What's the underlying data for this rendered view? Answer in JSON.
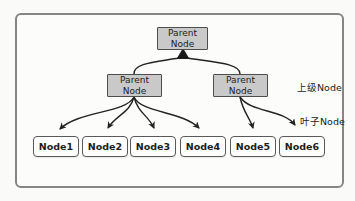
{
  "diagram": {
    "root": {
      "label": "Parent Node"
    },
    "parents": [
      {
        "label": "Parent Node"
      },
      {
        "label": "Parent Node"
      }
    ],
    "leaves": [
      {
        "label": "Node1"
      },
      {
        "label": "Node2"
      },
      {
        "label": "Node3"
      },
      {
        "label": "Node4"
      },
      {
        "label": "Node5"
      },
      {
        "label": "Node6"
      }
    ],
    "annotations": {
      "upper_level": "上级Node",
      "leaf_level": "叶子Node"
    },
    "edges": {
      "root_children": [
        "parent-left",
        "parent-right"
      ],
      "parent_left_children": [
        "Node1",
        "Node2",
        "Node3",
        "Node4"
      ],
      "parent_right_children": [
        "Node5",
        "Node6"
      ]
    },
    "colors": {
      "parent_fill": "#c9c9c9",
      "parent_border": "#4d4d4d",
      "leaf_fill": "#ffffff",
      "leaf_border": "#595959",
      "line": "#232323",
      "frame_border": "#858585",
      "background": "#fafaf9"
    }
  }
}
